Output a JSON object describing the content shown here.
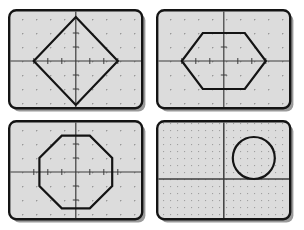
{
  "figure": {
    "title": "",
    "layout": "2x2 grid of geoboard panels",
    "panel_count": 4
  },
  "style": {
    "board_fill": "#dcdcdc",
    "board_border": "#141414",
    "board_shadow": "#9a9a9a",
    "axis_color": "#3d3d3d",
    "grid_dot_color": "#6e6e6e",
    "shape_stroke": "#141414",
    "page_background": "#ffffff",
    "board_corner_radius": 7,
    "board_border_width": 2.4,
    "axis_width": 1.2,
    "shape_stroke_width": 2.2
  },
  "panels": [
    {
      "id": "panel-diamond",
      "position": "top-left",
      "shape_name": "diamond",
      "shape_type": "polygon",
      "vertex_count": 4,
      "grid": {
        "columns": 9,
        "rows": 7,
        "spacing": 14,
        "dot_style": "plus",
        "density": "standard"
      },
      "axes": {
        "x_axis": true,
        "y_axis": true,
        "origin": "center",
        "ticks": true
      },
      "vertices": [
        [
          0,
          3
        ],
        [
          3,
          0
        ],
        [
          0,
          -3
        ],
        [
          -3,
          0
        ]
      ],
      "description": "Square rotated 45 degrees with vertices on the axes"
    },
    {
      "id": "panel-hexagon",
      "position": "top-right",
      "shape_name": "hexagon",
      "shape_type": "polygon",
      "vertex_count": 6,
      "grid": {
        "columns": 9,
        "rows": 7,
        "spacing": 14,
        "dot_style": "plus",
        "density": "standard"
      },
      "axes": {
        "x_axis": true,
        "y_axis": true,
        "origin": "center",
        "ticks": true
      },
      "vertices": [
        [
          -1.5,
          2
        ],
        [
          1.5,
          2
        ],
        [
          3,
          0
        ],
        [
          1.5,
          -2
        ],
        [
          -1.5,
          -2
        ],
        [
          -3,
          0
        ]
      ],
      "description": "Hexagon with flat top and bottom edges, left and right vertices on the x-axis"
    },
    {
      "id": "panel-octagon",
      "position": "bottom-left",
      "shape_name": "octagon",
      "shape_type": "polygon",
      "vertex_count": 8,
      "grid": {
        "columns": 9,
        "rows": 7,
        "spacing": 14,
        "dot_style": "plus",
        "density": "standard"
      },
      "axes": {
        "x_axis": true,
        "y_axis": true,
        "origin": "center",
        "ticks": true
      },
      "vertices": [
        [
          -1,
          2.6
        ],
        [
          1,
          2.6
        ],
        [
          2.6,
          1
        ],
        [
          2.6,
          -1
        ],
        [
          1,
          -2.6
        ],
        [
          -1,
          -2.6
        ],
        [
          -2.6,
          -1
        ],
        [
          -2.6,
          1
        ]
      ],
      "description": "Regular octagon centered on the origin"
    },
    {
      "id": "panel-circle",
      "position": "bottom-right",
      "shape_name": "circle",
      "shape_type": "circle",
      "vertex_count": 0,
      "grid": {
        "columns": 18,
        "rows": 14,
        "spacing": 7,
        "dot_style": "plus",
        "density": "fine"
      },
      "axes": {
        "x_axis": true,
        "y_axis": true,
        "origin": "center",
        "ticks": false
      },
      "circle": {
        "center": [
          2.1,
          1.5
        ],
        "radius": 1.5
      },
      "description": "Circle in the upper-right quadrant, tangent to the x-axis"
    }
  ]
}
